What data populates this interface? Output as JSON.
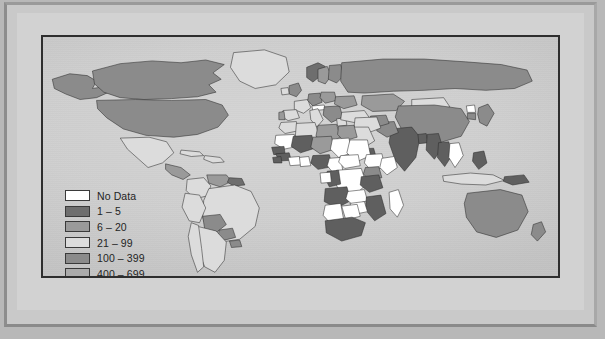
{
  "figure": {
    "type": "choropleth-world-map",
    "background_color": "#b8b8b8",
    "ocean_color": "#cfcfcf",
    "border_color": "#2e2e2e"
  },
  "legend": {
    "name": "map-legend",
    "entries": [
      {
        "label": "No Data",
        "color": "#ffffff",
        "range_min": null,
        "range_max": null
      },
      {
        "label": "1 – 5",
        "color": "#6e6e6e",
        "range_min": 1,
        "range_max": 5
      },
      {
        "label": "6 – 20",
        "color": "#9a9a9a",
        "range_min": 6,
        "range_max": 20
      },
      {
        "label": "21 – 99",
        "color": "#dcdcdc",
        "range_min": 21,
        "range_max": 99
      },
      {
        "label": "100 – 399",
        "color": "#8b8b8b",
        "range_min": 100,
        "range_max": 399
      },
      {
        "label": "400 – 699",
        "color": "#ababab",
        "range_min": 400,
        "range_max": 699
      },
      {
        "label": "700 or more",
        "color": "#5f5f5f",
        "range_min": 700,
        "range_max": null
      }
    ]
  },
  "chart_data": {
    "type": "map",
    "title": "",
    "xlabel": "",
    "ylabel": "",
    "classes": [
      "No Data",
      "1 – 5",
      "6 – 20",
      "21 – 99",
      "100 – 399",
      "400 – 699",
      "700 or more"
    ],
    "class_colors": [
      "#ffffff",
      "#6e6e6e",
      "#9a9a9a",
      "#dcdcdc",
      "#8b8b8b",
      "#ababab",
      "#5f5f5f"
    ],
    "legend_position": "lower-left",
    "grid": false,
    "regions": [
      {
        "name": "Canada",
        "class": "100 – 399"
      },
      {
        "name": "United States",
        "class": "100 – 399"
      },
      {
        "name": "Greenland",
        "class": "21 – 99"
      },
      {
        "name": "Alaska",
        "class": "100 – 399"
      },
      {
        "name": "Mexico",
        "class": "21 – 99"
      },
      {
        "name": "Central America",
        "class": "6 – 20"
      },
      {
        "name": "Cuba",
        "class": "21 – 99"
      },
      {
        "name": "Caribbean",
        "class": "21 – 99"
      },
      {
        "name": "Colombia",
        "class": "21 – 99"
      },
      {
        "name": "Venezuela",
        "class": "6 – 20"
      },
      {
        "name": "Guyanas",
        "class": "1 – 5"
      },
      {
        "name": "Brazil",
        "class": "21 – 99"
      },
      {
        "name": "Peru",
        "class": "21 – 99"
      },
      {
        "name": "Bolivia",
        "class": "100 – 399"
      },
      {
        "name": "Paraguay",
        "class": "100 – 399"
      },
      {
        "name": "Uruguay",
        "class": "100 – 399"
      },
      {
        "name": "Argentina",
        "class": "21 – 99"
      },
      {
        "name": "Chile",
        "class": "21 – 99"
      },
      {
        "name": "Norway",
        "class": "1 – 5"
      },
      {
        "name": "Sweden",
        "class": "6 – 20"
      },
      {
        "name": "Finland",
        "class": "100 – 399"
      },
      {
        "name": "United Kingdom",
        "class": "100 – 399"
      },
      {
        "name": "Ireland",
        "class": "21 – 99"
      },
      {
        "name": "France",
        "class": "21 – 99"
      },
      {
        "name": "Spain",
        "class": "21 – 99"
      },
      {
        "name": "Portugal",
        "class": "6 – 20"
      },
      {
        "name": "Germany",
        "class": "100 – 399"
      },
      {
        "name": "Poland",
        "class": "6 – 20"
      },
      {
        "name": "Austria",
        "class": "No Data"
      },
      {
        "name": "Italy",
        "class": "21 – 99"
      },
      {
        "name": "Balkans",
        "class": "100 – 399"
      },
      {
        "name": "Greece",
        "class": "21 – 99"
      },
      {
        "name": "Ukraine",
        "class": "6 – 20"
      },
      {
        "name": "Russia",
        "class": "100 – 399"
      },
      {
        "name": "Turkey",
        "class": "21 – 99"
      },
      {
        "name": "Kazakhstan",
        "class": "6 – 20"
      },
      {
        "name": "Mongolia",
        "class": "21 – 99"
      },
      {
        "name": "China",
        "class": "100 – 399"
      },
      {
        "name": "Japan",
        "class": "100 – 399"
      },
      {
        "name": "North Korea",
        "class": "No Data"
      },
      {
        "name": "South Korea",
        "class": "100 – 399"
      },
      {
        "name": "India",
        "class": "700 or more"
      },
      {
        "name": "Pakistan",
        "class": "100 – 399"
      },
      {
        "name": "Afghanistan",
        "class": "100 – 399"
      },
      {
        "name": "Iran",
        "class": "21 – 99"
      },
      {
        "name": "Saudi Arabia",
        "class": "21 – 99"
      },
      {
        "name": "Yemen",
        "class": "700 or more"
      },
      {
        "name": "Bangladesh",
        "class": "700 or more"
      },
      {
        "name": "Myanmar",
        "class": "700 or more"
      },
      {
        "name": "Thailand",
        "class": "700 or more"
      },
      {
        "name": "Vietnam",
        "class": "No Data"
      },
      {
        "name": "Indonesia",
        "class": "21 – 99"
      },
      {
        "name": "Philippines",
        "class": "700 or more"
      },
      {
        "name": "Papua New Guinea",
        "class": "700 or more"
      },
      {
        "name": "Australia",
        "class": "100 – 399"
      },
      {
        "name": "New Zealand",
        "class": "100 – 399"
      },
      {
        "name": "Morocco",
        "class": "21 – 99"
      },
      {
        "name": "Algeria",
        "class": "21 – 99"
      },
      {
        "name": "Libya",
        "class": "6 – 20"
      },
      {
        "name": "Egypt",
        "class": "6 – 20"
      },
      {
        "name": "Mauritania",
        "class": "No Data"
      },
      {
        "name": "Mali",
        "class": "700 or more"
      },
      {
        "name": "Niger",
        "class": "6 – 20"
      },
      {
        "name": "Chad",
        "class": "No Data"
      },
      {
        "name": "Sudan",
        "class": "No Data"
      },
      {
        "name": "Ethiopia",
        "class": "No Data"
      },
      {
        "name": "Somalia",
        "class": "No Data"
      },
      {
        "name": "Senegal",
        "class": "700 or more"
      },
      {
        "name": "Guinea",
        "class": "700 or more"
      },
      {
        "name": "Sierra Leone",
        "class": "700 or more"
      },
      {
        "name": "Ivory Coast",
        "class": "No Data"
      },
      {
        "name": "Ghana",
        "class": "No Data"
      },
      {
        "name": "Nigeria",
        "class": "700 or more"
      },
      {
        "name": "Cameroon",
        "class": "No Data"
      },
      {
        "name": "Central African Rep.",
        "class": "No Data"
      },
      {
        "name": "Dem. Rep. Congo",
        "class": "No Data"
      },
      {
        "name": "Congo",
        "class": "700 or more"
      },
      {
        "name": "Gabon",
        "class": "No Data"
      },
      {
        "name": "Angola",
        "class": "700 or more"
      },
      {
        "name": "Zambia",
        "class": "No Data"
      },
      {
        "name": "Kenya",
        "class": "100 – 399"
      },
      {
        "name": "Tanzania",
        "class": "700 or more"
      },
      {
        "name": "Mozambique",
        "class": "700 or more"
      },
      {
        "name": "Zimbabwe",
        "class": "No Data"
      },
      {
        "name": "Madagascar",
        "class": "No Data"
      },
      {
        "name": "Namibia",
        "class": "No Data"
      },
      {
        "name": "Botswana",
        "class": "No Data"
      },
      {
        "name": "South Africa",
        "class": "700 or more"
      }
    ]
  }
}
